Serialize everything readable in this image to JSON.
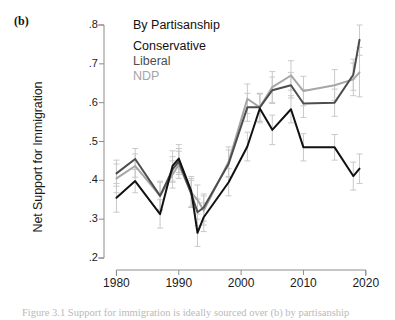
{
  "panel": {
    "letter": "(b)"
  },
  "legend": {
    "title": "By Partisanship",
    "items": [
      {
        "label": "Conservative",
        "color": "#111111"
      },
      {
        "label": "Liberal",
        "color": "#4d4d4d"
      },
      {
        "label": "NDP",
        "color": "#a6a6a6"
      }
    ]
  },
  "caption": "Figure 3.1  Support for immigration is ideally sourced over (b) by partisanship",
  "chart_data": {
    "type": "line",
    "title": "By Partisanship",
    "xlabel": "",
    "ylabel": "Net Support for Immigration",
    "xlim": [
      1978,
      2021
    ],
    "ylim": [
      0.2,
      0.8
    ],
    "yticks": [
      0.2,
      0.3,
      0.4,
      0.5,
      0.6,
      0.7,
      0.8
    ],
    "ytick_labels": [
      ".2",
      ".3",
      ".4",
      ".5",
      ".6",
      ".7",
      ".8"
    ],
    "xticks": [
      1980,
      1990,
      2000,
      2010,
      2020
    ],
    "xtick_labels": [
      "1980",
      "1990",
      "2000",
      "2010",
      "2020"
    ],
    "grid": false,
    "legend_position": "top-left-inside",
    "error_bars": "vertical 95% confidence intervals on every point",
    "x": [
      1980,
      1983,
      1987,
      1989,
      1990,
      1992,
      1993,
      1994,
      1998,
      2001,
      2003,
      2005,
      2008,
      2010,
      2015,
      2018,
      2019
    ],
    "series": [
      {
        "name": "Conservative",
        "color": "#111111",
        "values": [
          0.355,
          0.398,
          0.313,
          0.437,
          0.456,
          0.372,
          0.265,
          0.305,
          0.395,
          0.487,
          0.585,
          0.53,
          0.583,
          0.485,
          0.485,
          0.411,
          0.43
        ],
        "ci_low": [
          0.318,
          0.368,
          0.277,
          0.398,
          0.42,
          0.333,
          0.23,
          0.268,
          0.36,
          0.45,
          0.548,
          0.492,
          0.548,
          0.45,
          0.452,
          0.375,
          0.392
        ],
        "ci_high": [
          0.392,
          0.428,
          0.35,
          0.476,
          0.492,
          0.41,
          0.3,
          0.342,
          0.43,
          0.524,
          0.622,
          0.568,
          0.618,
          0.52,
          0.518,
          0.447,
          0.468
        ]
      },
      {
        "name": "Liberal",
        "color": "#4d4d4d",
        "values": [
          0.418,
          0.455,
          0.36,
          0.428,
          0.448,
          0.365,
          0.318,
          0.33,
          0.443,
          0.588,
          0.588,
          0.632,
          0.645,
          0.598,
          0.6,
          0.672,
          0.762
        ],
        "ci_low": [
          0.385,
          0.428,
          0.325,
          0.395,
          0.415,
          0.33,
          0.283,
          0.295,
          0.408,
          0.552,
          0.552,
          0.598,
          0.612,
          0.562,
          0.565,
          0.632,
          0.722
        ],
        "ci_high": [
          0.452,
          0.482,
          0.395,
          0.461,
          0.482,
          0.4,
          0.352,
          0.365,
          0.478,
          0.624,
          0.624,
          0.666,
          0.678,
          0.634,
          0.635,
          0.712,
          0.8
        ]
      },
      {
        "name": "NDP",
        "color": "#a6a6a6",
        "values": [
          0.405,
          0.437,
          0.36,
          0.415,
          0.44,
          0.368,
          0.35,
          0.322,
          0.448,
          0.61,
          0.588,
          0.64,
          0.67,
          0.63,
          0.645,
          0.66,
          0.678
        ],
        "ci_low": [
          0.368,
          0.408,
          0.322,
          0.38,
          0.405,
          0.33,
          0.313,
          0.285,
          0.41,
          0.572,
          0.552,
          0.6,
          0.632,
          0.592,
          0.605,
          0.618,
          0.615
        ],
        "ci_high": [
          0.442,
          0.468,
          0.398,
          0.45,
          0.475,
          0.405,
          0.388,
          0.36,
          0.486,
          0.648,
          0.624,
          0.68,
          0.708,
          0.668,
          0.685,
          0.702,
          0.742
        ]
      }
    ]
  }
}
